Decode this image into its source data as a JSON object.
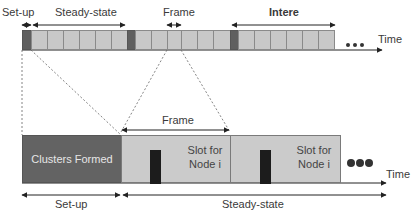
{
  "diagram": {
    "type": "timeline-frame-structure",
    "top_timeline": {
      "labels": {
        "setup": "Set-up",
        "steady_state": "Steady-state",
        "frame": "Frame",
        "interval": "Intere",
        "time": "Time"
      },
      "cells": [
        {
          "type": "setup"
        },
        {
          "type": "slot"
        },
        {
          "type": "slot"
        },
        {
          "type": "slot"
        },
        {
          "type": "slot"
        },
        {
          "type": "slot"
        },
        {
          "type": "slot"
        },
        {
          "type": "slot"
        },
        {
          "type": "setup"
        },
        {
          "type": "slot"
        },
        {
          "type": "slot"
        },
        {
          "type": "slot"
        },
        {
          "type": "slot"
        },
        {
          "type": "slot"
        },
        {
          "type": "slot"
        },
        {
          "type": "slot"
        },
        {
          "type": "slot"
        },
        {
          "type": "setup"
        },
        {
          "type": "slot"
        },
        {
          "type": "slot"
        },
        {
          "type": "slot"
        },
        {
          "type": "slot"
        },
        {
          "type": "slot"
        },
        {
          "type": "slot"
        },
        {
          "type": "slot"
        }
      ],
      "ellipsis": "•••"
    },
    "bottom_timeline": {
      "setup_box": "Clusters Formed",
      "frame_label": "Frame",
      "slots": [
        {
          "label_line1": "Slot for",
          "label_line2": "Node i"
        },
        {
          "label_line1": "Slot for",
          "label_line2": "Node i"
        }
      ],
      "setup_label": "Set-up",
      "steady_state_label": "Steady-state",
      "time_label": "Time",
      "ellipsis": "●●●"
    },
    "colors": {
      "setup_cell": "#5f5f5f",
      "slot_cell": "#c8c8c8",
      "transmission_bar": "#1c1c1c",
      "line": "#333333"
    }
  }
}
